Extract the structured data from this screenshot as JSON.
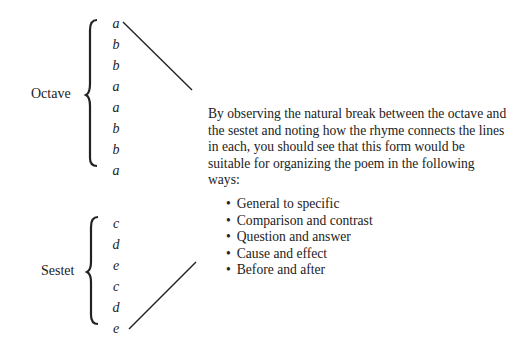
{
  "octave": {
    "label": "Octave",
    "rhymes": [
      "a",
      "b",
      "b",
      "a",
      "a",
      "b",
      "b",
      "a"
    ]
  },
  "sestet": {
    "label": "Sestet",
    "rhymes": [
      "c",
      "d",
      "e",
      "c",
      "d",
      "e"
    ]
  },
  "paragraph": "By observing the natural break between the octave and the sestet and noting how the rhyme connects the lines in each, you should see that this form would be suitable for organizing the poem in the following ways:",
  "ways": [
    "General to specific",
    "Comparison and contrast",
    "Question and answer",
    "Cause and effect",
    "Before and after"
  ]
}
